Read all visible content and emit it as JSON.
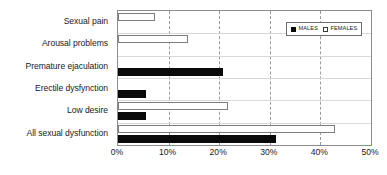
{
  "chart_data": {
    "type": "bar",
    "orientation": "horizontal",
    "title": "",
    "xlabel": "",
    "ylabel": "",
    "xlim": [
      0,
      50
    ],
    "xtick_labels": [
      "0%",
      "10%",
      "20%",
      "30%",
      "40%",
      "50%"
    ],
    "xtick_values": [
      0,
      10,
      20,
      30,
      40,
      50
    ],
    "grid": true,
    "grid_axis": "x",
    "grid_style": "dashed",
    "legend_position": "top-right",
    "categories": [
      "Sexual pain",
      "Arousal problems",
      "Premature ejaculation",
      "Erectile dysfynction",
      "Low desire",
      "All sexual dysfunction"
    ],
    "series": [
      {
        "name": "MALES",
        "color": "#0a0a0a",
        "swatch": "filled-square",
        "values": [
          null,
          null,
          20.8,
          5.5,
          5.5,
          31.2
        ]
      },
      {
        "name": "FEMALES",
        "color": "#ffffff",
        "swatch": "open-square",
        "values": [
          7.4,
          13.9,
          null,
          null,
          21.8,
          42.9
        ]
      }
    ]
  },
  "legend": {
    "items": [
      {
        "label": "MALES",
        "swatch": "filled-square-icon"
      },
      {
        "label": "FEMALES",
        "swatch": "open-square-icon"
      }
    ]
  }
}
